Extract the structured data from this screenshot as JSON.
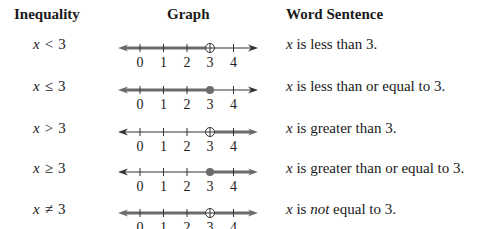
{
  "headers": {
    "inequality": "Inequality",
    "graph": "Graph",
    "word_sentence": "Word Sentence"
  },
  "axis": {
    "ticks": [
      "0",
      "1",
      "2",
      "3",
      "4"
    ],
    "colors": {
      "line": "#333333",
      "shade": "#6b6b6b"
    }
  },
  "rows": [
    {
      "var": "x",
      "op": "<",
      "value": "3",
      "sentence_pre": " is less than 3.",
      "sentence_em": "",
      "sentence_post": "",
      "endpoint": "open",
      "direction": "left"
    },
    {
      "var": "x",
      "op": "≤",
      "value": "3",
      "sentence_pre": " is less than or equal to 3.",
      "sentence_em": "",
      "sentence_post": "",
      "endpoint": "closed",
      "direction": "left"
    },
    {
      "var": "x",
      "op": ">",
      "value": "3",
      "sentence_pre": " is greater than 3.",
      "sentence_em": "",
      "sentence_post": "",
      "endpoint": "open",
      "direction": "right"
    },
    {
      "var": "x",
      "op": "≥",
      "value": "3",
      "sentence_pre": " is greater than or equal to 3.",
      "sentence_em": "",
      "sentence_post": "",
      "endpoint": "closed",
      "direction": "right"
    },
    {
      "var": "x",
      "op": "≠",
      "value": "3",
      "sentence_pre": " is ",
      "sentence_em": "not",
      "sentence_post": " equal to 3.",
      "endpoint": "open",
      "direction": "both"
    }
  ]
}
